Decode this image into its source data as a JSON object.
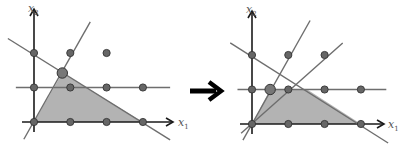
{
  "diagram": {
    "colors": {
      "region_fill": "#b3b3b3",
      "axis": "#1a1a1a",
      "constraint_line": "#6e6e6e",
      "lattice_point": "#666666",
      "lattice_point_stroke": "#333333",
      "transition_arrow": "#000000"
    },
    "transition_arrow": {
      "direction": "right",
      "meaning": "before to after"
    },
    "panels": [
      {
        "id": "before",
        "axis_labels": {
          "x": "x",
          "x_sub": "1",
          "y": "x",
          "y_sub": "2"
        },
        "lattice_points": [
          [
            0,
            0
          ],
          [
            1,
            0
          ],
          [
            2,
            0
          ],
          [
            3,
            0
          ],
          [
            0,
            1
          ],
          [
            1,
            1
          ],
          [
            2,
            1
          ],
          [
            3,
            1
          ],
          [
            0,
            2
          ],
          [
            1,
            2
          ],
          [
            2,
            2
          ]
        ],
        "highlight_vertex": [
          0.78,
          1.42
        ],
        "feasible_region": [
          [
            0,
            0
          ],
          [
            0.78,
            1.42
          ],
          [
            3,
            0
          ]
        ],
        "lines": [
          {
            "name": "constraint-steep",
            "from": [
              -0.28,
              -0.5
            ],
            "to": [
              1.55,
              2.9
            ]
          },
          {
            "name": "constraint-descending",
            "from": [
              -0.72,
              2.42
            ],
            "to": [
              3.75,
              -0.52
            ]
          },
          {
            "name": "cut-horizontal",
            "from": [
              -0.5,
              1
            ],
            "to": [
              3.75,
              1
            ]
          }
        ]
      },
      {
        "id": "after",
        "axis_labels": {
          "x": "x",
          "x_sub": "1",
          "y": "x",
          "y_sub": "2"
        },
        "lattice_points": [
          [
            0,
            0
          ],
          [
            1,
            0
          ],
          [
            2,
            0
          ],
          [
            3,
            0
          ],
          [
            0,
            1
          ],
          [
            1,
            1
          ],
          [
            2,
            1
          ],
          [
            3,
            1
          ],
          [
            0,
            2
          ],
          [
            1,
            2
          ],
          [
            2,
            2
          ]
        ],
        "highlight_vertex": [
          0.5,
          1
        ],
        "feasible_region": [
          [
            0,
            0
          ],
          [
            0.5,
            1
          ],
          [
            1.52,
            1
          ],
          [
            3,
            0
          ]
        ],
        "lines": [
          {
            "name": "constraint-steep",
            "from": [
              -0.25,
              -0.47
            ],
            "to": [
              1.6,
              3.0
            ]
          },
          {
            "name": "cut-shallow",
            "from": [
              -0.3,
              -0.27
            ],
            "to": [
              2.5,
              2.35
            ]
          },
          {
            "name": "constraint-descending",
            "from": [
              -0.6,
              2.35
            ],
            "to": [
              3.75,
              -0.55
            ]
          },
          {
            "name": "cut-horizontal",
            "from": [
              -0.4,
              1
            ],
            "to": [
              3.7,
              1
            ]
          }
        ]
      }
    ]
  }
}
